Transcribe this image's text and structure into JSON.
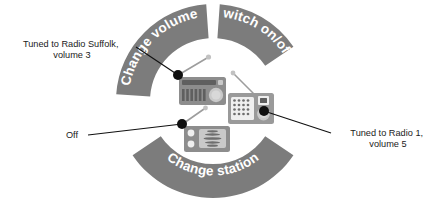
{
  "diagram": {
    "background_color": "#ffffff",
    "ring": {
      "color": "#7c7c7c",
      "label_color": "#ffffff",
      "center_x": 213,
      "center_y": 101,
      "outer_radius": 97,
      "inner_radius": 63,
      "segments": [
        {
          "id": "change-volume",
          "label": "Change volume",
          "start_angle": 184,
          "end_angle": 266,
          "flipped": false
        },
        {
          "id": "switch-on-off",
          "label": "Switch on/off",
          "start_angle": 274,
          "end_angle": 326,
          "flipped": false
        },
        {
          "id": "change-station",
          "label": "Change station",
          "start_angle": 34,
          "end_angle": 146,
          "flipped": true
        }
      ]
    },
    "states": [
      {
        "id": "state-radio-suffolk",
        "icon": "radio-icon",
        "dot_x": 178,
        "dot_y": 75,
        "label": "Tuned to Radio Suffolk, volume 3",
        "label_lines": [
          "Tuned to Radio Suffolk,",
          "volume 3"
        ],
        "label_x": 72,
        "label_y": 47,
        "label_align": "middle",
        "leader_from_x": 136,
        "leader_from_y": 47
      },
      {
        "id": "state-radio-1",
        "icon": "radio-icon",
        "dot_x": 264,
        "dot_y": 111,
        "label": "Tuned to Radio 1, volume 5",
        "label_lines": [
          "Tuned to Radio 1,",
          "volume 5"
        ],
        "label_x": 388,
        "label_y": 136,
        "label_align": "middle",
        "leader_from_x": 331,
        "leader_from_y": 133
      },
      {
        "id": "state-off",
        "icon": "radio-icon",
        "dot_x": 182,
        "dot_y": 124,
        "label": "Off",
        "label_lines": [
          "Off"
        ],
        "label_x": 72,
        "label_y": 138,
        "label_align": "middle",
        "leader_from_x": 88,
        "leader_from_y": 135
      }
    ]
  }
}
